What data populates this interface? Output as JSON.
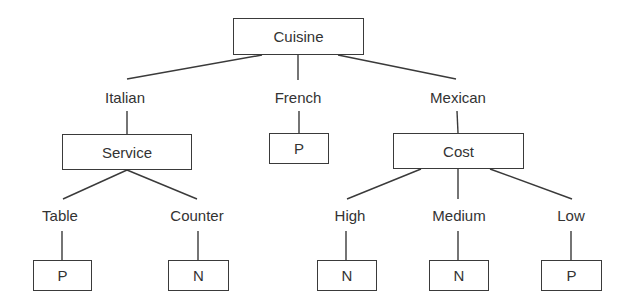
{
  "diagram": {
    "type": "decision-tree",
    "root": {
      "id": "cuisine",
      "label": "Cuisine",
      "box": {
        "x": 233,
        "y": 18,
        "w": 131,
        "h": 37
      }
    },
    "branches": [
      {
        "id": "italian",
        "label": "Italian",
        "pos": {
          "x": 125,
          "y": 97
        }
      },
      {
        "id": "french",
        "label": "French",
        "pos": {
          "x": 298,
          "y": 97
        }
      },
      {
        "id": "mexican",
        "label": "Mexican",
        "pos": {
          "x": 458,
          "y": 97
        }
      }
    ],
    "internal_nodes": [
      {
        "id": "service",
        "label": "Service",
        "parent_branch": "Italian",
        "box": {
          "x": 62,
          "y": 134,
          "w": 130,
          "h": 36
        }
      },
      {
        "id": "cost",
        "label": "Cost",
        "parent_branch": "Mexican",
        "box": {
          "x": 393,
          "y": 133,
          "w": 131,
          "h": 36
        }
      }
    ],
    "sub_branches": [
      {
        "id": "table",
        "label": "Table",
        "parent": "Service",
        "pos": {
          "x": 60,
          "y": 215
        }
      },
      {
        "id": "counter",
        "label": "Counter",
        "parent": "Service",
        "pos": {
          "x": 197,
          "y": 215
        }
      },
      {
        "id": "high",
        "label": "High",
        "parent": "Cost",
        "pos": {
          "x": 350,
          "y": 215
        }
      },
      {
        "id": "medium",
        "label": "Medium",
        "parent": "Cost",
        "pos": {
          "x": 459,
          "y": 215
        }
      },
      {
        "id": "low",
        "label": "Low",
        "parent": "Cost",
        "pos": {
          "x": 571,
          "y": 215
        }
      }
    ],
    "leaves": [
      {
        "id": "leaf-french",
        "label": "P",
        "path": "Cuisine=French",
        "box": {
          "x": 269,
          "y": 133,
          "w": 60,
          "h": 31
        }
      },
      {
        "id": "leaf-table",
        "label": "P",
        "path": "Cuisine=Italian, Service=Table",
        "box": {
          "x": 33,
          "y": 260,
          "w": 59,
          "h": 31
        }
      },
      {
        "id": "leaf-counter",
        "label": "N",
        "path": "Cuisine=Italian, Service=Counter",
        "box": {
          "x": 168,
          "y": 260,
          "w": 61,
          "h": 31
        }
      },
      {
        "id": "leaf-high",
        "label": "N",
        "path": "Cuisine=Mexican, Cost=High",
        "box": {
          "x": 317,
          "y": 260,
          "w": 60,
          "h": 31
        }
      },
      {
        "id": "leaf-medium",
        "label": "N",
        "path": "Cuisine=Mexican, Cost=Medium",
        "box": {
          "x": 429,
          "y": 260,
          "w": 60,
          "h": 31
        }
      },
      {
        "id": "leaf-low",
        "label": "P",
        "path": "Cuisine=Mexican, Cost=Low",
        "box": {
          "x": 541,
          "y": 260,
          "w": 61,
          "h": 31
        }
      }
    ],
    "colors": {
      "line": "#3a3a3a",
      "text": "#333333",
      "background": "#ffffff"
    }
  }
}
